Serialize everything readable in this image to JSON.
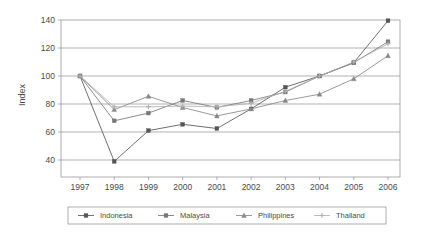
{
  "chart_data": {
    "type": "line",
    "title": "",
    "xlabel": "",
    "ylabel": "Index",
    "categories": [
      "1997",
      "1998",
      "1999",
      "2000",
      "2001",
      "2002",
      "2003",
      "2004",
      "2005",
      "2006"
    ],
    "x": [
      1997,
      1998,
      1999,
      2000,
      2001,
      2002,
      2003,
      2004,
      2005,
      2006
    ],
    "ylim": [
      30,
      145
    ],
    "yticks": [
      40,
      60,
      80,
      100,
      120,
      140
    ],
    "ytick_labels": [
      "40",
      "60",
      "80",
      "100",
      "120",
      "140"
    ],
    "grid": "horizontal",
    "legend_position": "bottom",
    "series": [
      {
        "name": "Indonesia",
        "marker": "square",
        "color": "#555555",
        "values": [
          100,
          39,
          61,
          65.5,
          62.5,
          76.5,
          92,
          100,
          109.5,
          139.5
        ]
      },
      {
        "name": "Malaysia",
        "marker": "square",
        "color": "#777777",
        "values": [
          100,
          68,
          73.5,
          82.5,
          77.5,
          82.5,
          88.5,
          100,
          109.5,
          124.5
        ]
      },
      {
        "name": "Philippines",
        "marker": "triangle",
        "color": "#888888",
        "values": [
          100,
          76,
          85.5,
          77.5,
          71.5,
          76.5,
          82.5,
          87,
          98,
          114.5
        ]
      },
      {
        "name": "Thailand",
        "marker": "cross",
        "color": "#b0b0b0",
        "values": [
          100,
          78,
          78,
          78.5,
          78,
          80.5,
          89,
          100,
          110,
          123
        ]
      }
    ]
  },
  "axis": {
    "y_title": "Index",
    "y_ticks": [
      "140",
      "120",
      "100",
      "80",
      "60",
      "40"
    ],
    "x_ticks": [
      "1997",
      "1998",
      "1999",
      "2000",
      "2001",
      "2002",
      "2003",
      "2004",
      "2005",
      "2006"
    ]
  },
  "legend": {
    "items": [
      {
        "label": "Indonesia"
      },
      {
        "label": "Malaysia"
      },
      {
        "label": "Philippines"
      },
      {
        "label": "Thailand"
      }
    ]
  }
}
